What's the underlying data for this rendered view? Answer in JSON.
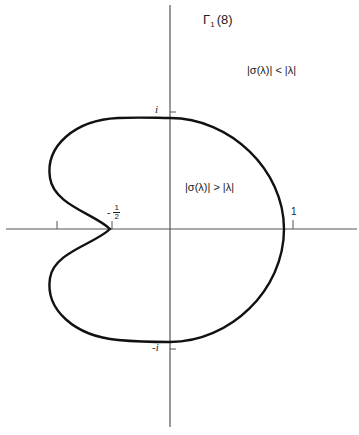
{
  "title_main": "Γ",
  "title_sub": "1",
  "title_arg": "(8)",
  "regions": {
    "outside": "|σ(λ)| < |λ|",
    "inside": "|σ(λ)| > |λ|"
  },
  "axis_labels": {
    "i": "i",
    "minus_i": "-i",
    "one": "1",
    "minus_half_sign": "-",
    "minus_half_num": "1",
    "minus_half_den": "2"
  },
  "colors": {
    "axis": "#555555",
    "curve": "#111111",
    "text": "#222222",
    "background": "#ffffff"
  },
  "geometry": {
    "origin": [
      170,
      229
    ],
    "unit_px": 118,
    "curve_points_complex": {
      "right_crossing": 0.97,
      "top_crossing": "0.94i",
      "bottom_crossing": "-0.96i",
      "cusp": -0.5,
      "leftmost": -1.02
    }
  }
}
